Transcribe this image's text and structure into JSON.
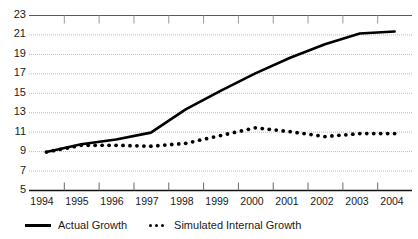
{
  "chart_data": {
    "type": "line",
    "title": "",
    "xlabel": "",
    "ylabel": "",
    "categories": [
      "1994",
      "1995",
      "1996",
      "1997",
      "1998",
      "1999",
      "2000",
      "2001",
      "2002",
      "2003",
      "2004"
    ],
    "ylim": [
      5,
      23
    ],
    "ytick_step": 2,
    "yticks": [
      "5",
      "7",
      "9",
      "11",
      "13",
      "15",
      "17",
      "19",
      "21",
      "23"
    ],
    "grid": true,
    "legend_position": "bottom-left",
    "series": [
      {
        "name": "Actual Growth",
        "style": "solid",
        "color": "#000000",
        "values": [
          8.9,
          9.7,
          10.2,
          10.9,
          13.3,
          15.2,
          17.0,
          18.6,
          20.0,
          21.1,
          21.3
        ]
      },
      {
        "name": "Simulated Internal Growth",
        "style": "dotted",
        "color": "#000000",
        "values": [
          8.9,
          9.6,
          9.6,
          9.5,
          9.8,
          10.6,
          11.4,
          11.0,
          10.5,
          10.8,
          10.8
        ]
      }
    ]
  },
  "legend": {
    "items": [
      {
        "label": "Actual Growth",
        "marker": "solid-line-marker"
      },
      {
        "label": "Simulated Internal Growth",
        "marker": "dotted-line-marker"
      }
    ]
  },
  "axes": {
    "y_labels": [
      "23",
      "21",
      "19",
      "17",
      "15",
      "13",
      "11",
      "9",
      "7",
      "5"
    ],
    "x_labels": [
      "1994",
      "1995",
      "1996",
      "1997",
      "1998",
      "1999",
      "2000",
      "2001",
      "2002",
      "2003",
      "2004"
    ]
  }
}
